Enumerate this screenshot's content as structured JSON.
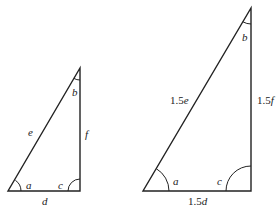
{
  "diagram": {
    "type": "similar-triangles",
    "scale_factor": "1.5",
    "small_triangle": {
      "vertices": {
        "left": [
          8,
          191
        ],
        "right": [
          80,
          191
        ],
        "top": [
          80,
          68
        ]
      },
      "sides": {
        "hypotenuse": "e",
        "vertical": "f",
        "base": "d"
      },
      "angles": {
        "left": "a",
        "right": "c",
        "top": "b"
      }
    },
    "large_triangle": {
      "vertices": {
        "left": [
          143,
          191
        ],
        "right": [
          251,
          191
        ],
        "top": [
          251,
          8
        ]
      },
      "sides": {
        "hypotenuse_num": "1.5",
        "hypotenuse_var": "e",
        "vertical_num": "1.5",
        "vertical_var": "f",
        "base_num": "1.5",
        "base_var": "d"
      },
      "angles": {
        "left": "a",
        "right": "c",
        "top": "b"
      }
    }
  }
}
